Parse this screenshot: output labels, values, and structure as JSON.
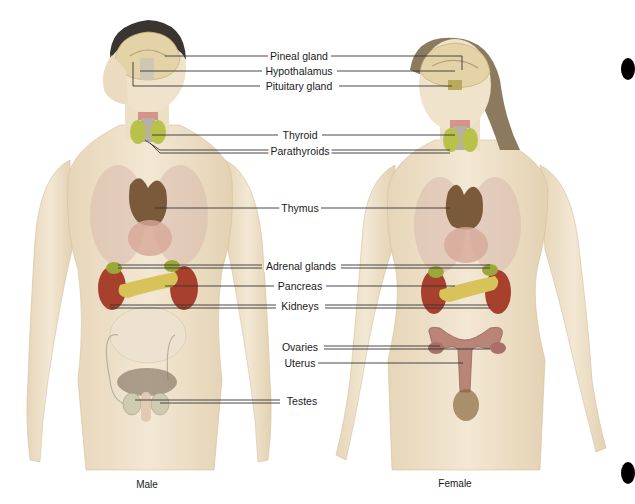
{
  "figure": {
    "captions": {
      "male": "Male",
      "female": "Female"
    },
    "labels": [
      {
        "id": "pineal",
        "text": "Pineal gland",
        "y": 56,
        "x": 299
      },
      {
        "id": "hypothalamus",
        "text": "Hypothalamus",
        "y": 71,
        "x": 299
      },
      {
        "id": "pituitary",
        "text": "Pituitary gland",
        "y": 86,
        "x": 299
      },
      {
        "id": "thyroid",
        "text": "Thyroid",
        "y": 135,
        "x": 300
      },
      {
        "id": "parathyroids",
        "text": "Parathyroids",
        "y": 150,
        "x": 300
      },
      {
        "id": "thymus",
        "text": "Thymus",
        "y": 208,
        "x": 300
      },
      {
        "id": "adrenal",
        "text": "Adrenal glands",
        "y": 266,
        "x": 301
      },
      {
        "id": "pancreas",
        "text": "Pancreas",
        "y": 286,
        "x": 300
      },
      {
        "id": "kidneys",
        "text": "Kidneys",
        "y": 306,
        "x": 300
      },
      {
        "id": "ovaries",
        "text": "Ovaries",
        "y": 347,
        "x": 300
      },
      {
        "id": "uterus",
        "text": "Uterus",
        "y": 363,
        "x": 300
      },
      {
        "id": "testes",
        "text": "Testes",
        "y": 401,
        "x": 300
      }
    ],
    "colors": {
      "skin": "#efe3cc",
      "skin_shadow": "#d9c7a6",
      "brain": "#e3d3a6",
      "hair_male": "#3a3530",
      "hair_female": "#8c7a5e",
      "lung": "#d9b9ad",
      "thymus": "#7a5a3a",
      "thyroid": "#b8c24a",
      "kidney": "#a8402e",
      "pancreas": "#d8c25a",
      "adrenal": "#9aa83a",
      "uterus": "#b88578",
      "testes": "#cfcbb0",
      "line": "#333333"
    }
  }
}
